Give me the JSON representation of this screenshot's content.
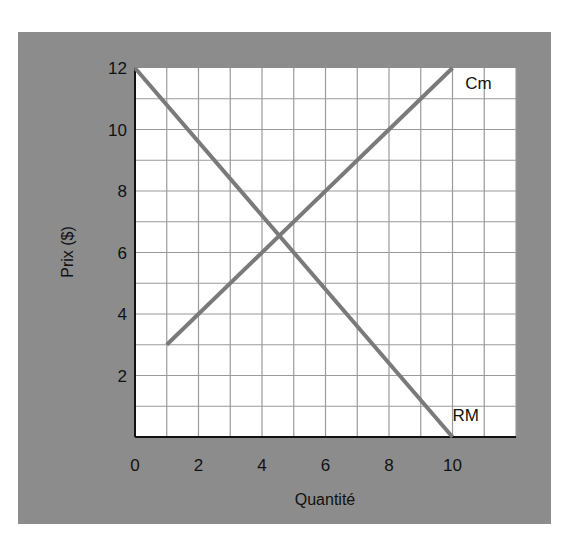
{
  "chart_data": {
    "type": "line",
    "title": "",
    "xlabel": "Quantité",
    "ylabel": "Prix ($)",
    "xlim": [
      0,
      12
    ],
    "ylim": [
      0,
      12
    ],
    "grid": true,
    "x_ticks": [
      0,
      2,
      4,
      6,
      8,
      10
    ],
    "y_ticks": [
      2,
      4,
      6,
      8,
      10,
      12
    ],
    "series": [
      {
        "name": "RM",
        "points": [
          [
            0,
            12
          ],
          [
            10,
            0
          ]
        ],
        "label_position": [
          10,
          0.7
        ]
      },
      {
        "name": "Cm",
        "points": [
          [
            1,
            3
          ],
          [
            10,
            12
          ]
        ],
        "label_position": [
          10.4,
          11.5
        ]
      }
    ],
    "intersection": {
      "x": 4.5,
      "y": 6.5
    }
  },
  "colors": {
    "panel_background": "#8c8c8c",
    "plot_background": "#ffffff",
    "grid_line": "#9a9a9a",
    "curve": "#7a7a7a",
    "axis": "#111111"
  }
}
